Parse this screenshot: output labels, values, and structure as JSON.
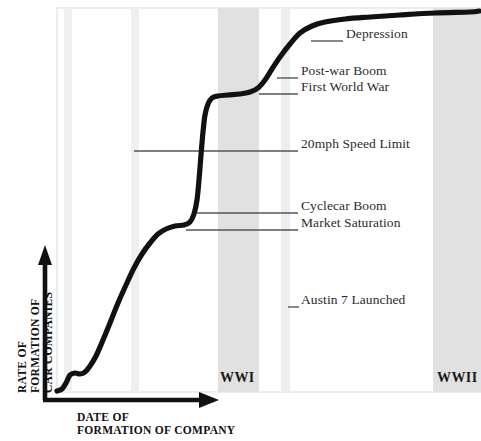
{
  "figure": {
    "title": "",
    "background_color": "#ffffff",
    "curve_color": "#111111",
    "band_color": "#e2e2e2",
    "narrow_band_color": "#eeeeee",
    "plot_border_color": "#d8d8d8",
    "leader_color": "#555555",
    "axis_color": "#111111"
  },
  "axes": {
    "y_label_lines": [
      "RATE OF",
      "FORMATION OF",
      "CAR COMPANIES"
    ],
    "x_label_lines": [
      "DATE OF",
      "FORMATION OF COMPANY"
    ],
    "y_label_text": "RATE OF FORMATION OF CAR COMPANIES",
    "x_label_text": "DATE OF FORMATION OF COMPANY"
  },
  "bands": [
    {
      "name": "narrow-band-1",
      "label": "",
      "x": 64,
      "width": 8,
      "shade": "#efefef"
    },
    {
      "name": "narrow-band-2",
      "label": "",
      "x": 131,
      "width": 8,
      "shade": "#efefef"
    },
    {
      "name": "wwi-band",
      "label": "WWI",
      "x": 218,
      "width": 41,
      "shade": "#e1e1e1"
    },
    {
      "name": "narrow-band-3",
      "label": "",
      "x": 281,
      "width": 9,
      "shade": "#eeeeee"
    },
    {
      "name": "wwii-band",
      "label": "WWII",
      "x": 433,
      "width": 48,
      "shade": "#e1e1e1"
    }
  ],
  "annotations": [
    {
      "id": "depression",
      "label": "Depression",
      "text_x": 346,
      "text_y": 34,
      "leader_x1": 311,
      "leader_x2": 343,
      "leader_y": 41
    },
    {
      "id": "post-war-boom",
      "label": "Post-war Boom",
      "text_x": 301,
      "text_y": 71,
      "leader_x1": 277,
      "leader_x2": 298,
      "leader_y": 78
    },
    {
      "id": "first-world-war",
      "label": "First World War",
      "text_x": 301,
      "text_y": 87,
      "leader_x1": 259,
      "leader_x2": 298,
      "leader_y": 94
    },
    {
      "id": "20mph-speed-limit",
      "label": "20mph Speed Limit",
      "text_x": 301,
      "text_y": 144,
      "leader_x1": 134,
      "leader_x2": 298,
      "leader_y": 151
    },
    {
      "id": "cyclecar-boom",
      "label": "Cyclecar Boom",
      "text_x": 301,
      "text_y": 206,
      "leader_x1": 197,
      "leader_x2": 298,
      "leader_y": 213
    },
    {
      "id": "market-saturation",
      "label": "Market Saturation",
      "text_x": 301,
      "text_y": 223,
      "leader_x1": 186,
      "leader_x2": 298,
      "leader_y": 230
    },
    {
      "id": "austin-7-launched",
      "label": "Austin 7 Launched",
      "text_x": 301,
      "text_y": 300,
      "leader_x1": 288,
      "leader_x2": 299,
      "leader_y": 307
    }
  ],
  "chart_data": {
    "type": "line",
    "xlabel": "DATE OF FORMATION OF COMPANY",
    "ylabel": "RATE OF FORMATION OF CAR COMPANIES",
    "axis_ticks": "none",
    "grid": false,
    "legend": "none",
    "series": [
      {
        "name": "Rate of formation of car companies",
        "color": "#111111",
        "points": [
          {
            "x": 57,
            "y": 391
          },
          {
            "x": 62,
            "y": 389
          },
          {
            "x": 66,
            "y": 383
          },
          {
            "x": 70,
            "y": 375
          },
          {
            "x": 75,
            "y": 373
          },
          {
            "x": 80,
            "y": 374
          },
          {
            "x": 85,
            "y": 372
          },
          {
            "x": 90,
            "y": 366
          },
          {
            "x": 96,
            "y": 356
          },
          {
            "x": 103,
            "y": 340
          },
          {
            "x": 110,
            "y": 323
          },
          {
            "x": 118,
            "y": 303
          },
          {
            "x": 126,
            "y": 285
          },
          {
            "x": 134,
            "y": 268
          },
          {
            "x": 142,
            "y": 254
          },
          {
            "x": 150,
            "y": 243
          },
          {
            "x": 158,
            "y": 234
          },
          {
            "x": 166,
            "y": 229
          },
          {
            "x": 175,
            "y": 226
          },
          {
            "x": 184,
            "y": 225
          },
          {
            "x": 190,
            "y": 222
          },
          {
            "x": 194,
            "y": 214
          },
          {
            "x": 197,
            "y": 200
          },
          {
            "x": 199,
            "y": 180
          },
          {
            "x": 201,
            "y": 155
          },
          {
            "x": 203,
            "y": 132
          },
          {
            "x": 205,
            "y": 115
          },
          {
            "x": 208,
            "y": 104
          },
          {
            "x": 212,
            "y": 98
          },
          {
            "x": 218,
            "y": 96
          },
          {
            "x": 228,
            "y": 95
          },
          {
            "x": 240,
            "y": 94
          },
          {
            "x": 250,
            "y": 92
          },
          {
            "x": 258,
            "y": 88
          },
          {
            "x": 265,
            "y": 80
          },
          {
            "x": 272,
            "y": 69
          },
          {
            "x": 280,
            "y": 57
          },
          {
            "x": 290,
            "y": 44
          },
          {
            "x": 300,
            "y": 33
          },
          {
            "x": 312,
            "y": 26
          },
          {
            "x": 325,
            "y": 22
          },
          {
            "x": 345,
            "y": 19
          },
          {
            "x": 370,
            "y": 17
          },
          {
            "x": 400,
            "y": 15
          },
          {
            "x": 435,
            "y": 13
          },
          {
            "x": 470,
            "y": 12
          },
          {
            "x": 479,
            "y": 11
          }
        ]
      }
    ],
    "shaded_regions": [
      {
        "label": "",
        "x_start": 64,
        "x_end": 72
      },
      {
        "label": "",
        "x_start": 131,
        "x_end": 139
      },
      {
        "label": "WWI",
        "x_start": 218,
        "x_end": 259
      },
      {
        "label": "",
        "x_start": 281,
        "x_end": 290
      },
      {
        "label": "WWII",
        "x_start": 433,
        "x_end": 481
      }
    ],
    "event_annotations": [
      "Depression",
      "Post-war Boom",
      "First World War",
      "20mph Speed Limit",
      "Cyclecar Boom",
      "Market Saturation",
      "Austin 7 Launched"
    ]
  }
}
